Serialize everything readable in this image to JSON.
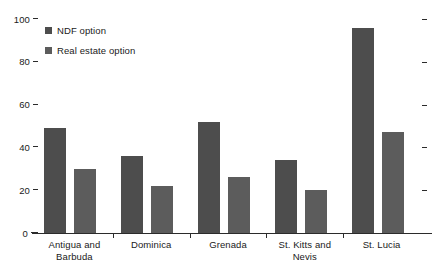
{
  "chart_data": {
    "type": "bar",
    "title": "",
    "subtitle": "",
    "xlabel": "",
    "ylabel": "",
    "ylim": [
      0,
      100
    ],
    "yticks": [
      0,
      20,
      40,
      60,
      80,
      100
    ],
    "ytick_labels": [
      "0",
      "20",
      "40",
      "60",
      "80",
      "100"
    ],
    "grid": false,
    "legend_position": "top-left",
    "right_axis_ticks": true,
    "categories": [
      "Antigua and Barbuda",
      "Dominica",
      "Grenada",
      "St. Kitts and Nevis",
      "St. Lucia"
    ],
    "category_lines": [
      [
        "Antigua and",
        "Barbuda"
      ],
      [
        "Dominica"
      ],
      [
        "Grenada"
      ],
      [
        "St. Kitts and",
        "Nevis"
      ],
      [
        "St. Lucia"
      ]
    ],
    "series": [
      {
        "name": "NDF option",
        "color": "#4d4d4d",
        "values": [
          49,
          36,
          52,
          34,
          96
        ]
      },
      {
        "name": "Real estate option",
        "color": "#5c5c5c",
        "values": [
          30,
          22,
          26,
          20,
          47
        ]
      }
    ]
  }
}
